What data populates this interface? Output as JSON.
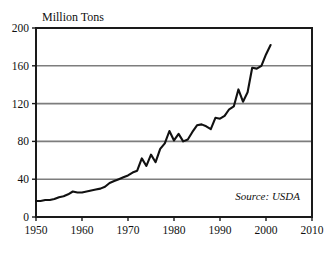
{
  "chart_data": {
    "type": "line",
    "title": "Million Tons",
    "xlabel": "",
    "ylabel": "",
    "ylim": [
      0,
      200
    ],
    "xlim": [
      1950,
      2010
    ],
    "yticks": [
      0,
      40,
      80,
      120,
      160,
      200
    ],
    "xticks": [
      1950,
      1960,
      1970,
      1980,
      1990,
      2000,
      2010
    ],
    "grid": "horizontal",
    "legend": "none",
    "annotations": [
      {
        "name": "source-note",
        "text": "Source: USDA",
        "position": "bottom-right-inside-plot"
      }
    ],
    "series": [
      {
        "name": "production",
        "color": "#111111",
        "x": [
          1950,
          1951,
          1952,
          1953,
          1954,
          1955,
          1956,
          1957,
          1958,
          1959,
          1960,
          1961,
          1962,
          1963,
          1964,
          1965,
          1966,
          1967,
          1968,
          1969,
          1970,
          1971,
          1972,
          1973,
          1974,
          1975,
          1976,
          1977,
          1978,
          1979,
          1980,
          1981,
          1982,
          1983,
          1984,
          1985,
          1986,
          1987,
          1988,
          1989,
          1990,
          1991,
          1992,
          1993,
          1994,
          1995,
          1996,
          1997,
          1998,
          1999,
          2000,
          2001
        ],
        "values": [
          17,
          17,
          18,
          18,
          19,
          21,
          22,
          24,
          27,
          26,
          26,
          27,
          28,
          29,
          30,
          32,
          36,
          38,
          40,
          42,
          44,
          47,
          49,
          62,
          54,
          66,
          58,
          72,
          78,
          91,
          81,
          88,
          80,
          82,
          90,
          97,
          98,
          96,
          93,
          105,
          104,
          107,
          114,
          117,
          135,
          122,
          132,
          158,
          157,
          160,
          172,
          182
        ]
      }
    ]
  },
  "plot": {
    "frame_color": "#1a1a1a",
    "grid_color": "#7d7d7d",
    "background": "#ffffff"
  }
}
